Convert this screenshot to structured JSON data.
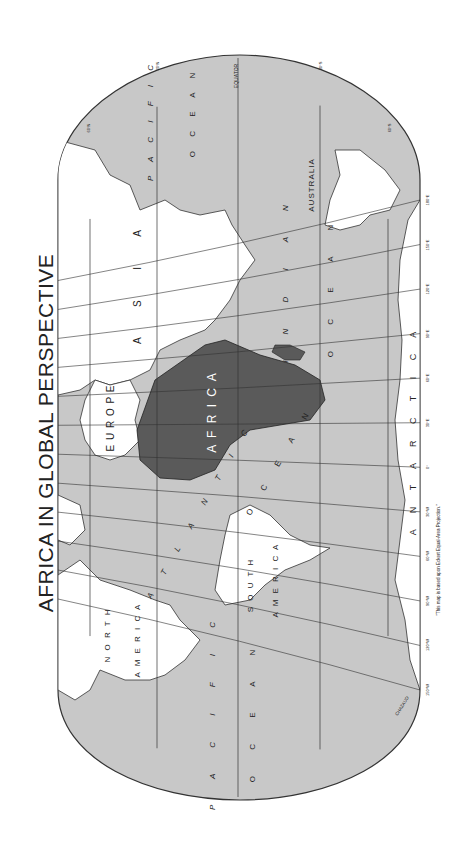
{
  "title": "AFRICA IN GLOBAL PERSPECTIVE",
  "footnote": "\"This map is based upon Eckert Equal-Area Projection.\"",
  "credit": "CHAZAUD",
  "colors": {
    "ocean": "#c8c8c8",
    "land": "#ffffff",
    "africa": "#5a5a5a",
    "lines": "#333333"
  },
  "latitude_labels": [
    "60°N",
    "30°N",
    "EQUATOR",
    "30°S",
    "60°S"
  ],
  "longitude_labels": [
    "150°W",
    "120°W",
    "90°W",
    "60°W",
    "30°W",
    "0°",
    "30°E",
    "60°E",
    "90°E",
    "120°E",
    "150°E",
    "180°E"
  ],
  "continents": {
    "africa": "A F R I C A",
    "europe": "E U R O P E",
    "asia": "A S I A",
    "north_america_1": "N O R T H",
    "north_america_2": "A M E R I C A",
    "south_america_1": "S O U T H",
    "south_america_2": "A M E R I C A",
    "australia": "AUSTRALIA",
    "antarctica": "A N T A R C T I C A"
  },
  "oceans": {
    "pacific_top_1": "P A C I F I C",
    "pacific_top_2": "O C E A N",
    "indian_1": "I N D I A N",
    "indian_2": "O C E A N",
    "atlantic_1": "A T L A N T I C",
    "atlantic_2": "O C E A N",
    "pacific_bottom_1": "P A C I F I C",
    "pacific_bottom_2": "O C E A N"
  }
}
